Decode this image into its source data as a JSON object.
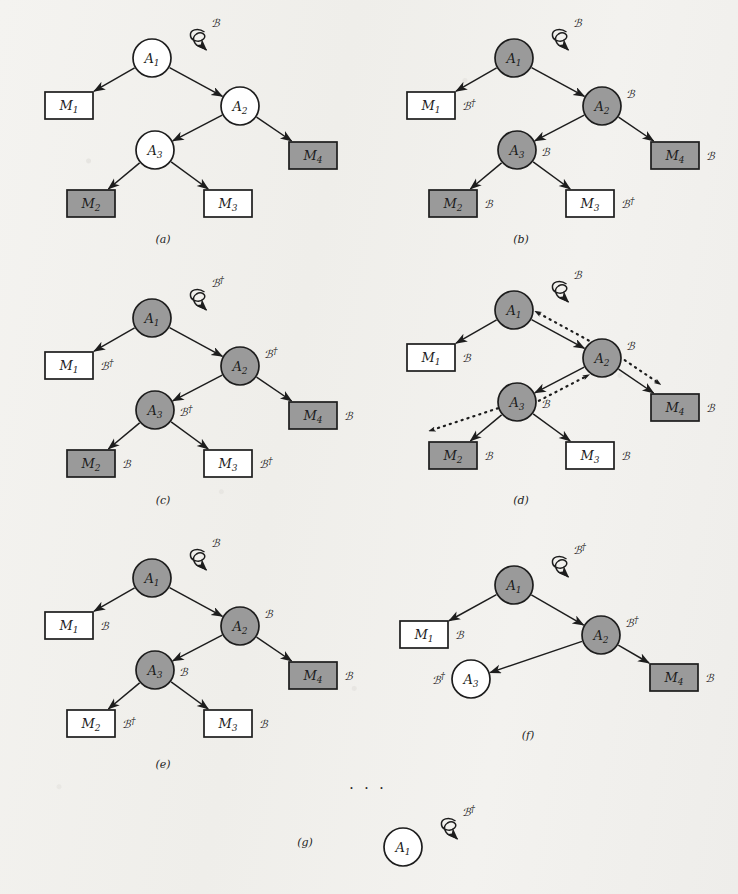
{
  "figure": {
    "colors": {
      "paper": "#f2f1ee",
      "ink": "#1d1d1d",
      "shaded_fill": "#9a9a9a",
      "empty_fill": "#ffffff"
    },
    "symbols": {
      "beta": "ℬ",
      "beta_dagger": "ℬ†",
      "dagger": "†",
      "ellipsis": "· · ·"
    },
    "ellipsis_marker": "· · ·",
    "panels": [
      {
        "id": "a",
        "caption": "(a)",
        "caption_pos": {
          "x": 163,
          "y": 243
        },
        "root_input": {
          "label": "ℬ",
          "target": "A1"
        },
        "nodes": [
          {
            "id": "A1",
            "label": "A",
            "sub": "1",
            "x": 152,
            "y": 58,
            "r": 19,
            "shaded": false,
            "side_label": "",
            "side_pos": "right"
          },
          {
            "id": "A2",
            "label": "A",
            "sub": "2",
            "x": 240,
            "y": 106,
            "r": 19,
            "shaded": false,
            "side_label": "",
            "side_pos": "right"
          },
          {
            "id": "A3",
            "label": "A",
            "sub": "3",
            "x": 155,
            "y": 150,
            "r": 19,
            "shaded": false,
            "side_label": "",
            "side_pos": "right"
          }
        ],
        "boxes": [
          {
            "id": "M1",
            "label": "M",
            "sub": "1",
            "x": 45,
            "y": 92,
            "w": 48,
            "h": 27,
            "shaded": false,
            "side_label": ""
          },
          {
            "id": "M4",
            "label": "M",
            "sub": "4",
            "x": 289,
            "y": 142,
            "w": 48,
            "h": 27,
            "shaded": true,
            "side_label": ""
          },
          {
            "id": "M2",
            "label": "M",
            "sub": "2",
            "x": 67,
            "y": 190,
            "w": 48,
            "h": 27,
            "shaded": true,
            "side_label": ""
          },
          {
            "id": "M3",
            "label": "M",
            "sub": "3",
            "x": 204,
            "y": 190,
            "w": 48,
            "h": 27,
            "shaded": false,
            "side_label": ""
          }
        ],
        "edges": [
          {
            "from": "A1",
            "to": "M1",
            "style": "solid"
          },
          {
            "from": "A1",
            "to": "A2",
            "style": "solid"
          },
          {
            "from": "A2",
            "to": "A3",
            "style": "solid"
          },
          {
            "from": "A2",
            "to": "M4",
            "style": "solid"
          },
          {
            "from": "A3",
            "to": "M2",
            "style": "solid"
          },
          {
            "from": "A3",
            "to": "M3",
            "style": "solid"
          }
        ]
      },
      {
        "id": "b",
        "caption": "(b)",
        "caption_pos": {
          "x": 521,
          "y": 243
        },
        "root_input": {
          "label": "ℬ",
          "target": "A1"
        },
        "nodes": [
          {
            "id": "A1",
            "label": "A",
            "sub": "1",
            "x": 514,
            "y": 58,
            "r": 19,
            "shaded": true,
            "side_label": "",
            "side_pos": "right"
          },
          {
            "id": "A2",
            "label": "A",
            "sub": "2",
            "x": 602,
            "y": 106,
            "r": 19,
            "shaded": true,
            "side_label": "ℬ",
            "side_pos": "upper-right"
          },
          {
            "id": "A3",
            "label": "A",
            "sub": "3",
            "x": 517,
            "y": 150,
            "r": 19,
            "shaded": true,
            "side_label": "ℬ",
            "side_pos": "right"
          }
        ],
        "boxes": [
          {
            "id": "M1",
            "label": "M",
            "sub": "1",
            "x": 407,
            "y": 92,
            "w": 48,
            "h": 27,
            "shaded": false,
            "side_label": "ℬ†"
          },
          {
            "id": "M4",
            "label": "M",
            "sub": "4",
            "x": 651,
            "y": 142,
            "w": 48,
            "h": 27,
            "shaded": true,
            "side_label": "ℬ"
          },
          {
            "id": "M2",
            "label": "M",
            "sub": "2",
            "x": 429,
            "y": 190,
            "w": 48,
            "h": 27,
            "shaded": true,
            "side_label": "ℬ"
          },
          {
            "id": "M3",
            "label": "M",
            "sub": "3",
            "x": 566,
            "y": 190,
            "w": 48,
            "h": 27,
            "shaded": false,
            "side_label": "ℬ†"
          }
        ],
        "edges": [
          {
            "from": "A1",
            "to": "M1",
            "style": "solid"
          },
          {
            "from": "A1",
            "to": "A2",
            "style": "solid"
          },
          {
            "from": "A2",
            "to": "A3",
            "style": "solid"
          },
          {
            "from": "A2",
            "to": "M4",
            "style": "solid"
          },
          {
            "from": "A3",
            "to": "M2",
            "style": "solid"
          },
          {
            "from": "A3",
            "to": "M3",
            "style": "solid"
          }
        ]
      },
      {
        "id": "c",
        "caption": "(c)",
        "caption_pos": {
          "x": 163,
          "y": 504
        },
        "root_input": {
          "label": "ℬ†",
          "target": "A1"
        },
        "nodes": [
          {
            "id": "A1",
            "label": "A",
            "sub": "1",
            "x": 152,
            "y": 318,
            "r": 19,
            "shaded": true,
            "side_label": "",
            "side_pos": "right"
          },
          {
            "id": "A2",
            "label": "A",
            "sub": "2",
            "x": 240,
            "y": 366,
            "r": 19,
            "shaded": true,
            "side_label": "ℬ†",
            "side_pos": "upper-right"
          },
          {
            "id": "A3",
            "label": "A",
            "sub": "3",
            "x": 155,
            "y": 410,
            "r": 19,
            "shaded": true,
            "side_label": "ℬ†",
            "side_pos": "right"
          }
        ],
        "boxes": [
          {
            "id": "M1",
            "label": "M",
            "sub": "1",
            "x": 45,
            "y": 352,
            "w": 48,
            "h": 27,
            "shaded": false,
            "side_label": "ℬ†"
          },
          {
            "id": "M4",
            "label": "M",
            "sub": "4",
            "x": 289,
            "y": 402,
            "w": 48,
            "h": 27,
            "shaded": true,
            "side_label": "ℬ"
          },
          {
            "id": "M2",
            "label": "M",
            "sub": "2",
            "x": 67,
            "y": 450,
            "w": 48,
            "h": 27,
            "shaded": true,
            "side_label": "ℬ"
          },
          {
            "id": "M3",
            "label": "M",
            "sub": "3",
            "x": 204,
            "y": 450,
            "w": 48,
            "h": 27,
            "shaded": false,
            "side_label": "ℬ†"
          }
        ],
        "edges": [
          {
            "from": "A1",
            "to": "M1",
            "style": "solid"
          },
          {
            "from": "A1",
            "to": "A2",
            "style": "solid"
          },
          {
            "from": "A2",
            "to": "A3",
            "style": "solid"
          },
          {
            "from": "A2",
            "to": "M4",
            "style": "solid"
          },
          {
            "from": "A3",
            "to": "M2",
            "style": "solid"
          },
          {
            "from": "A3",
            "to": "M3",
            "style": "solid"
          }
        ]
      },
      {
        "id": "d",
        "caption": "(d)",
        "caption_pos": {
          "x": 521,
          "y": 504
        },
        "root_input": {
          "label": "ℬ",
          "target": "A1"
        },
        "nodes": [
          {
            "id": "A1",
            "label": "A",
            "sub": "1",
            "x": 514,
            "y": 310,
            "r": 19,
            "shaded": true,
            "side_label": "",
            "side_pos": "right"
          },
          {
            "id": "A2",
            "label": "A",
            "sub": "2",
            "x": 602,
            "y": 358,
            "r": 19,
            "shaded": true,
            "side_label": "ℬ",
            "side_pos": "upper-right"
          },
          {
            "id": "A3",
            "label": "A",
            "sub": "3",
            "x": 517,
            "y": 402,
            "r": 19,
            "shaded": true,
            "side_label": "ℬ",
            "side_pos": "right"
          }
        ],
        "boxes": [
          {
            "id": "M1",
            "label": "M",
            "sub": "1",
            "x": 407,
            "y": 344,
            "w": 48,
            "h": 27,
            "shaded": false,
            "side_label": "ℬ"
          },
          {
            "id": "M4",
            "label": "M",
            "sub": "4",
            "x": 651,
            "y": 394,
            "w": 48,
            "h": 27,
            "shaded": true,
            "side_label": "ℬ"
          },
          {
            "id": "M2",
            "label": "M",
            "sub": "2",
            "x": 429,
            "y": 442,
            "w": 48,
            "h": 27,
            "shaded": true,
            "side_label": "ℬ"
          },
          {
            "id": "M3",
            "label": "M",
            "sub": "3",
            "x": 566,
            "y": 442,
            "w": 48,
            "h": 27,
            "shaded": false,
            "side_label": "ℬ"
          }
        ],
        "edges": [
          {
            "from": "A1",
            "to": "M1",
            "style": "solid"
          },
          {
            "from": "A1",
            "to": "A2",
            "style": "solid"
          },
          {
            "from": "A2",
            "to": "A3",
            "style": "solid"
          },
          {
            "from": "A2",
            "to": "M4",
            "style": "solid"
          },
          {
            "from": "A3",
            "to": "M2",
            "style": "solid"
          },
          {
            "from": "A3",
            "to": "M3",
            "style": "solid"
          },
          {
            "from": "A2",
            "to": "A1",
            "style": "dotted",
            "offset": 9
          },
          {
            "from": "A3",
            "to": "A2",
            "style": "dotted",
            "offset": 9
          },
          {
            "from": "A2",
            "to": "M4",
            "style": "dotted",
            "offset": -11
          },
          {
            "from": "A3",
            "to": "free",
            "style": "dotted",
            "free_to": {
              "x": 429,
              "y": 431
            }
          }
        ]
      },
      {
        "id": "e",
        "caption": "(e)",
        "caption_pos": {
          "x": 163,
          "y": 768
        },
        "root_input": {
          "label": "ℬ",
          "target": "A1"
        },
        "nodes": [
          {
            "id": "A1",
            "label": "A",
            "sub": "1",
            "x": 152,
            "y": 578,
            "r": 19,
            "shaded": true,
            "side_label": "",
            "side_pos": "right"
          },
          {
            "id": "A2",
            "label": "A",
            "sub": "2",
            "x": 240,
            "y": 626,
            "r": 19,
            "shaded": true,
            "side_label": "ℬ",
            "side_pos": "upper-right"
          },
          {
            "id": "A3",
            "label": "A",
            "sub": "3",
            "x": 155,
            "y": 670,
            "r": 19,
            "shaded": true,
            "side_label": "ℬ",
            "side_pos": "right"
          }
        ],
        "boxes": [
          {
            "id": "M1",
            "label": "M",
            "sub": "1",
            "x": 45,
            "y": 612,
            "w": 48,
            "h": 27,
            "shaded": false,
            "side_label": "ℬ"
          },
          {
            "id": "M4",
            "label": "M",
            "sub": "4",
            "x": 289,
            "y": 662,
            "w": 48,
            "h": 27,
            "shaded": true,
            "side_label": "ℬ"
          },
          {
            "id": "M2",
            "label": "M",
            "sub": "2",
            "x": 67,
            "y": 710,
            "w": 48,
            "h": 27,
            "shaded": false,
            "side_label": "ℬ†"
          },
          {
            "id": "M3",
            "label": "M",
            "sub": "3",
            "x": 204,
            "y": 710,
            "w": 48,
            "h": 27,
            "shaded": false,
            "side_label": "ℬ"
          }
        ],
        "edges": [
          {
            "from": "A1",
            "to": "M1",
            "style": "solid"
          },
          {
            "from": "A1",
            "to": "A2",
            "style": "solid"
          },
          {
            "from": "A2",
            "to": "A3",
            "style": "solid"
          },
          {
            "from": "A2",
            "to": "M4",
            "style": "solid"
          },
          {
            "from": "A3",
            "to": "M2",
            "style": "solid"
          },
          {
            "from": "A3",
            "to": "M3",
            "style": "solid"
          }
        ]
      },
      {
        "id": "f",
        "caption": "(f)",
        "caption_pos": {
          "x": 528,
          "y": 739
        },
        "root_input": {
          "label": "ℬ†",
          "target": "A1"
        },
        "nodes": [
          {
            "id": "A1",
            "label": "A",
            "sub": "1",
            "x": 514,
            "y": 585,
            "r": 19,
            "shaded": true,
            "side_label": "",
            "side_pos": "right"
          },
          {
            "id": "A2",
            "label": "A",
            "sub": "2",
            "x": 601,
            "y": 635,
            "r": 19,
            "shaded": true,
            "side_label": "ℬ†",
            "side_pos": "upper-right"
          },
          {
            "id": "A3",
            "label": "A",
            "sub": "3",
            "x": 471,
            "y": 679,
            "r": 19,
            "shaded": false,
            "side_label": "ℬ†",
            "side_pos": "left"
          }
        ],
        "boxes": [
          {
            "id": "M1",
            "label": "M",
            "sub": "1",
            "x": 400,
            "y": 621,
            "w": 48,
            "h": 27,
            "shaded": false,
            "side_label": "ℬ"
          },
          {
            "id": "M4",
            "label": "M",
            "sub": "4",
            "x": 650,
            "y": 664,
            "w": 48,
            "h": 27,
            "shaded": true,
            "side_label": "ℬ"
          }
        ],
        "edges": [
          {
            "from": "A1",
            "to": "M1",
            "style": "solid"
          },
          {
            "from": "A1",
            "to": "A2",
            "style": "solid"
          },
          {
            "from": "A2",
            "to": "A3",
            "style": "solid"
          },
          {
            "from": "A2",
            "to": "M4",
            "style": "solid"
          }
        ]
      },
      {
        "id": "g",
        "caption": "(g)",
        "caption_pos": {
          "x": 305,
          "y": 846
        },
        "root_input": {
          "label": "ℬ†",
          "target": "A1"
        },
        "nodes": [
          {
            "id": "A1",
            "label": "A",
            "sub": "1",
            "x": 403,
            "y": 847,
            "r": 19,
            "shaded": false,
            "side_label": "",
            "side_pos": "right"
          }
        ],
        "boxes": [],
        "edges": []
      }
    ]
  }
}
